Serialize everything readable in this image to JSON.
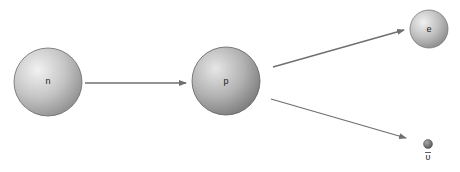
{
  "diagram": {
    "type": "beta-decay",
    "particles": [
      {
        "id": "neutron",
        "label": "n",
        "cx": 48,
        "cy": 82,
        "r": 34,
        "shade_light": "#e6e6e6",
        "shade_dark": "#9a9a9a"
      },
      {
        "id": "proton",
        "label": "p",
        "cx": 226,
        "cy": 81,
        "r": 34,
        "shade_light": "#d8d8d8",
        "shade_dark": "#858585"
      },
      {
        "id": "electron",
        "label": "e",
        "cx": 429,
        "cy": 29,
        "r": 19,
        "shade_light": "#e4e4e4",
        "shade_dark": "#939393"
      },
      {
        "id": "antineutrino",
        "label": "ῡ",
        "cx": 428,
        "cy": 144,
        "r": 5,
        "shade_light": "#9a9a9a",
        "shade_dark": "#5a5a5a"
      }
    ],
    "arrows": [
      {
        "from": "neutron",
        "to": "proton",
        "x1": 85,
        "y1": 83,
        "x2": 186,
        "y2": 83
      },
      {
        "from": "proton",
        "to": "electron",
        "x1": 273,
        "y1": 67,
        "x2": 404,
        "y2": 30
      },
      {
        "from": "proton",
        "to": "antineutrino",
        "x1": 271,
        "y1": 99,
        "x2": 406,
        "y2": 138
      }
    ],
    "arrow_color": "#6f6f6f"
  },
  "labels": {
    "neutron": "n",
    "proton": "p",
    "electron": "e",
    "antineutrino": "υ"
  }
}
